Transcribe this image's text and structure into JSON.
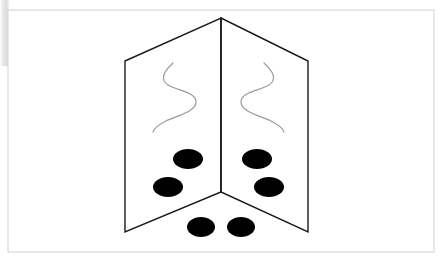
{
  "canvas": {
    "width": 444,
    "height": 261,
    "background_color": "#ffffff",
    "alt_text": "Line drawing of an open folded card seen in perspective with gray squiggles and black oval dots"
  },
  "frame": {
    "name": "outer-border",
    "x": 8,
    "y": 10,
    "width": 426,
    "height": 242,
    "stroke_color": "#d0d0d0",
    "stroke_width": 1,
    "fill_color": "#ffffff"
  },
  "shadow_strip": {
    "name": "left-edge-shadow",
    "x": 0,
    "y": 0,
    "width": 9,
    "height": 66,
    "color": "#dcdcdc"
  },
  "figure": {
    "stroke_color": "#1a1a1a",
    "stroke_width": 1.4,
    "fill_color": "#ffffff",
    "vertices": {
      "apex_top": [
        221,
        18
      ],
      "apex_bottom": [
        221,
        192
      ],
      "left_top_outer": [
        125,
        61
      ],
      "left_bottom_outer": [
        125,
        232
      ],
      "right_top_outer": [
        308,
        61
      ],
      "right_bottom_outer": [
        308,
        232
      ]
    },
    "panels": [
      {
        "name": "left-panel",
        "points": "125,61 221,18 221,192 125,232"
      },
      {
        "name": "right-panel",
        "points": "221,18 308,61 308,232 221,192"
      }
    ],
    "fold_line": {
      "name": "center-fold",
      "x1": 221,
      "y1": 18,
      "x2": 221,
      "y2": 192
    }
  },
  "squiggles": [
    {
      "name": "left-squiggle",
      "stroke_color": "#9a9a9a",
      "stroke_width": 1.2,
      "path": "M 173 63 C 163 72 160 80 168 85 C 178 91 196 92 196 102 C 196 112 176 116 166 121 C 158 125 154 128 153 132"
    },
    {
      "name": "right-squiggle",
      "stroke_color": "#9a9a9a",
      "stroke_width": 1.2,
      "path": "M 264 63 C 274 72 277 80 269 85 C 259 91 241 92 241 102 C 241 112 261 116 271 121 C 279 125 283 128 284 132"
    }
  ],
  "dots": {
    "fill_color": "#000000",
    "items": [
      {
        "name": "dot-left-upper",
        "cx": 188,
        "cy": 159,
        "rx": 15,
        "ry": 10,
        "group": "left-panel"
      },
      {
        "name": "dot-left-lower",
        "cx": 168,
        "cy": 187,
        "rx": 15,
        "ry": 10,
        "group": "left-panel"
      },
      {
        "name": "dot-right-upper",
        "cx": 257,
        "cy": 159,
        "rx": 15,
        "ry": 10,
        "group": "right-panel"
      },
      {
        "name": "dot-right-lower",
        "cx": 269,
        "cy": 187,
        "rx": 15,
        "ry": 10,
        "group": "right-panel"
      },
      {
        "name": "dot-floor-left",
        "cx": 201,
        "cy": 227,
        "rx": 14,
        "ry": 10,
        "group": "floor"
      },
      {
        "name": "dot-floor-right",
        "cx": 241,
        "cy": 227,
        "rx": 14,
        "ry": 10,
        "group": "floor"
      }
    ],
    "total_count": 6
  }
}
